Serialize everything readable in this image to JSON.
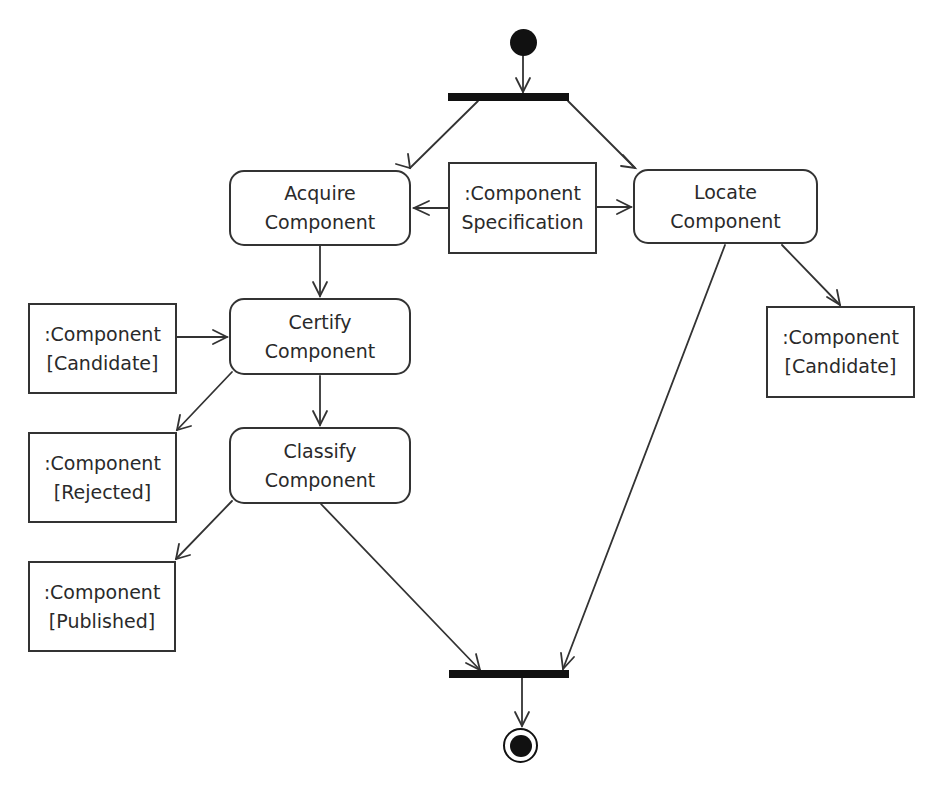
{
  "diagram": {
    "type": "UML activity diagram",
    "colors": {
      "stroke": "#333333",
      "fill_dark": "#111111",
      "background": "#ffffff"
    },
    "initial_node": {
      "label": ""
    },
    "final_node": {
      "label": ""
    },
    "fork_bar": {
      "label": ""
    },
    "join_bar": {
      "label": ""
    },
    "actions": {
      "acquire": {
        "line1": "Acquire",
        "line2": "Component"
      },
      "locate": {
        "line1": "Locate",
        "line2": "Component"
      },
      "certify": {
        "line1": "Certify",
        "line2": "Component"
      },
      "classify": {
        "line1": "Classify",
        "line2": "Component"
      }
    },
    "objects": {
      "specification": {
        "line1": ":Component",
        "line2": "Specification"
      },
      "candidate_left": {
        "line1": ":Component",
        "line2": "[Candidate]"
      },
      "rejected": {
        "line1": ":Component",
        "line2": "[Rejected]"
      },
      "published": {
        "line1": ":Component",
        "line2": "[Published]"
      },
      "candidate_right": {
        "line1": ":Component",
        "line2": "[Candidate]"
      }
    },
    "flows": [
      {
        "from": "initial_node",
        "to": "fork_bar"
      },
      {
        "from": "fork_bar",
        "to": "acquire"
      },
      {
        "from": "fork_bar",
        "to": "locate"
      },
      {
        "from": "specification",
        "to": "acquire"
      },
      {
        "from": "specification",
        "to": "locate"
      },
      {
        "from": "acquire",
        "to": "certify"
      },
      {
        "from": "candidate_left",
        "to": "certify"
      },
      {
        "from": "certify",
        "to": "rejected"
      },
      {
        "from": "certify",
        "to": "classify"
      },
      {
        "from": "classify",
        "to": "published"
      },
      {
        "from": "classify",
        "to": "join_bar"
      },
      {
        "from": "locate",
        "to": "candidate_right"
      },
      {
        "from": "locate",
        "to": "join_bar"
      },
      {
        "from": "join_bar",
        "to": "final_node"
      }
    ]
  }
}
